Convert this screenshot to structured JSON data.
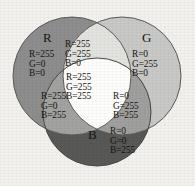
{
  "figure": {
    "type": "venn-diagram",
    "background_color": "#f2f1ee",
    "text_color": "#17150f",
    "rendering": "grayscale"
  },
  "circles": [
    {
      "key": "red",
      "label": "R",
      "cx": 72,
      "cy": 76,
      "r": 59,
      "fill_gray": "#8d8d8d"
    },
    {
      "key": "green",
      "label": "G",
      "cx": 122,
      "cy": 76,
      "r": 59,
      "fill_gray": "#c8c8c6"
    },
    {
      "key": "blue",
      "label": "B",
      "cx": 97,
      "cy": 112,
      "r": 54,
      "fill_gray": "#585856"
    }
  ],
  "regions": [
    {
      "key": "red",
      "name": "red-only",
      "lines": [
        "R=255",
        "G=0",
        "B=0"
      ],
      "fill_gray": "#8d8d8d"
    },
    {
      "key": "green",
      "name": "green-only",
      "lines": [
        "R=0",
        "G=255",
        "B=0"
      ],
      "fill_gray": "#c8c8c6"
    },
    {
      "key": "blue",
      "name": "blue-only",
      "lines": [
        "R=0",
        "G=0",
        "B=255"
      ],
      "fill_gray": "#585856"
    },
    {
      "key": "yellow",
      "name": "red-green-overlap",
      "lines": [
        "R=255",
        "G=255",
        "B=0"
      ],
      "fill_gray": "#e2e2de"
    },
    {
      "key": "magenta",
      "name": "red-blue-overlap",
      "lines": [
        "R=255",
        "G=0",
        "B=255"
      ],
      "fill_gray": "#a2a2a0"
    },
    {
      "key": "cyan",
      "name": "green-blue-overlap",
      "lines": [
        "R=0",
        "G=255",
        "B=255"
      ],
      "fill_gray": "#9f9f9d"
    },
    {
      "key": "white",
      "name": "all-three-overlap",
      "lines": [
        "R=255",
        "G=255",
        "B=255"
      ],
      "fill_gray": "#fdfdfb"
    }
  ],
  "labels": {
    "red_circle": "R",
    "green_circle": "G",
    "blue_circle": "B",
    "red_values": "R=255\nG=0\nB=0",
    "green_values": "R=0\nG=255\nB=0",
    "blue_values": "R=0\nG=0\nB=255",
    "yellow_values": "R=255\nG=255\nB=0",
    "magenta_values": "R=255\nG=0\nB=255",
    "cyan_values": "R=0\nG=255\nB=255",
    "white_values": "R=255\nG=255\nB=255"
  },
  "colors": {
    "red_fill": "#8d8d8d",
    "green_fill": "#c8c8c6",
    "blue_fill": "#585856",
    "yellow_fill": "#e2e2de",
    "magenta_fill": "#a2a2a0",
    "cyan_fill": "#9f9f9d",
    "white_fill": "#fdfdfb",
    "outline": "#5a5a58",
    "page": "#f2f1ee",
    "text": "#17150f"
  }
}
